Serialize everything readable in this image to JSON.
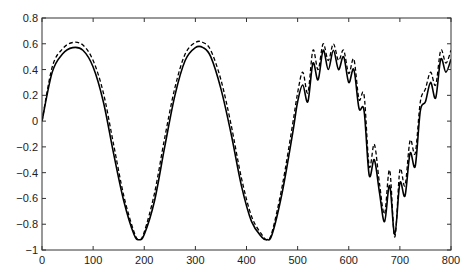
{
  "chart_data": {
    "type": "line",
    "title": "",
    "xlabel": "",
    "ylabel": "",
    "xlim": [
      0,
      800
    ],
    "ylim": [
      -1,
      0.8
    ],
    "grid": false,
    "legend": null,
    "xticks": [
      0,
      100,
      200,
      300,
      400,
      500,
      600,
      700,
      800
    ],
    "yticks": [
      0.8,
      0.6,
      0.4,
      0.2,
      0,
      -0.2,
      -0.4,
      -0.6,
      -0.8,
      -1
    ],
    "xtick_labels": [
      "0",
      "100",
      "200",
      "300",
      "400",
      "500",
      "600",
      "700",
      "800"
    ],
    "ytick_labels": [
      "0.8",
      "0.6",
      "0.4",
      "0.2",
      "0",
      "−0.2",
      "−0.4",
      "−0.6",
      "−0.8",
      "−1"
    ],
    "series": [
      {
        "name": "solid",
        "style": "solid",
        "color": "#000000",
        "x": [
          0,
          20,
          40,
          60,
          80,
          100,
          120,
          140,
          160,
          180,
          190,
          200,
          220,
          240,
          260,
          280,
          300,
          315,
          330,
          350,
          370,
          390,
          410,
          430,
          440,
          450,
          470,
          490,
          500,
          510,
          520,
          530,
          540,
          550,
          560,
          570,
          580,
          590,
          600,
          610,
          620,
          630,
          640,
          650,
          660,
          670,
          680,
          690,
          700,
          710,
          720,
          730,
          740,
          750,
          760,
          770,
          780,
          790,
          800
        ],
        "values": [
          0.0,
          0.38,
          0.52,
          0.57,
          0.55,
          0.42,
          0.15,
          -0.25,
          -0.62,
          -0.88,
          -0.92,
          -0.88,
          -0.62,
          -0.2,
          0.2,
          0.47,
          0.57,
          0.57,
          0.5,
          0.25,
          -0.1,
          -0.5,
          -0.78,
          -0.9,
          -0.92,
          -0.88,
          -0.55,
          -0.1,
          0.15,
          0.28,
          0.15,
          0.45,
          0.32,
          0.55,
          0.4,
          0.55,
          0.4,
          0.5,
          0.3,
          0.4,
          0.1,
          0.08,
          -0.42,
          -0.3,
          -0.55,
          -0.78,
          -0.5,
          -0.88,
          -0.48,
          -0.58,
          -0.25,
          -0.35,
          0.08,
          0.15,
          0.3,
          0.18,
          0.48,
          0.38,
          0.48
        ]
      },
      {
        "name": "dashed",
        "style": "dashed",
        "color": "#000000",
        "x": [
          0,
          20,
          40,
          60,
          80,
          100,
          120,
          140,
          160,
          180,
          190,
          200,
          220,
          240,
          260,
          280,
          300,
          315,
          330,
          350,
          370,
          390,
          410,
          430,
          440,
          450,
          470,
          490,
          500,
          510,
          520,
          530,
          540,
          550,
          560,
          570,
          580,
          590,
          600,
          610,
          620,
          630,
          640,
          650,
          660,
          670,
          680,
          690,
          700,
          710,
          720,
          730,
          740,
          750,
          760,
          770,
          780,
          790,
          800
        ],
        "values": [
          0.0,
          0.42,
          0.56,
          0.61,
          0.59,
          0.47,
          0.22,
          -0.18,
          -0.58,
          -0.86,
          -0.92,
          -0.86,
          -0.56,
          -0.13,
          0.26,
          0.52,
          0.61,
          0.61,
          0.55,
          0.32,
          -0.03,
          -0.44,
          -0.74,
          -0.88,
          -0.92,
          -0.86,
          -0.5,
          -0.03,
          0.22,
          0.38,
          0.22,
          0.55,
          0.4,
          0.6,
          0.47,
          0.6,
          0.47,
          0.55,
          0.37,
          0.48,
          0.17,
          0.2,
          -0.35,
          -0.18,
          -0.48,
          -0.72,
          -0.38,
          -0.9,
          -0.38,
          -0.5,
          -0.15,
          -0.25,
          0.15,
          0.25,
          0.38,
          0.28,
          0.55,
          0.45,
          0.55
        ]
      }
    ]
  }
}
